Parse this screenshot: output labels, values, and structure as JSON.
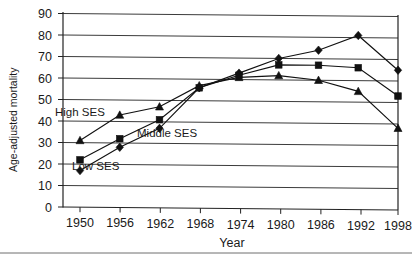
{
  "chart_data": {
    "type": "line",
    "title": "",
    "xlabel": "Year",
    "ylabel": "Age-adjusted mortality",
    "categories": [
      1950,
      1956,
      1962,
      1968,
      1974,
      1980,
      1986,
      1992,
      1998
    ],
    "x": [
      1950,
      1956,
      1962,
      1968,
      1974,
      1980,
      1986,
      1992,
      1998
    ],
    "xlim": [
      1950,
      1998
    ],
    "ylim": [
      0,
      90
    ],
    "yticks": [
      0,
      10,
      20,
      30,
      40,
      50,
      60,
      70,
      80,
      90
    ],
    "xticks": [
      "1950",
      "1956",
      "1962",
      "1968",
      "1974",
      "1980",
      "1986",
      "1992",
      "1998"
    ],
    "grid": "horizontal",
    "legend": "inline-annotations",
    "series": [
      {
        "name": "Low SES",
        "marker": "diamond",
        "values": [
          17,
          28,
          37,
          56,
          63,
          70,
          74,
          81,
          65
        ]
      },
      {
        "name": "Middle SES",
        "marker": "square",
        "values": [
          22,
          32,
          41,
          56,
          62,
          67,
          67,
          66,
          53
        ]
      },
      {
        "name": "High SES",
        "marker": "triangle",
        "values": [
          31,
          43,
          47,
          57,
          61,
          62,
          60,
          55,
          38
        ]
      }
    ],
    "annotations": [
      {
        "text": "High SES",
        "x_px": 55,
        "y_px": 112
      },
      {
        "text": "Middle SES",
        "x_px": 137,
        "y_px": 133
      },
      {
        "text": "Low SES",
        "x_px": 72,
        "y_px": 166
      }
    ]
  },
  "axes": {
    "y_title": "Age-adjusted mortality",
    "x_title": "Year",
    "y_tick_labels": [
      "90",
      "80",
      "70",
      "60",
      "50",
      "40",
      "30",
      "20",
      "10",
      "0"
    ],
    "x_tick_labels": [
      "1950",
      "1956",
      "1962",
      "1968",
      "1974",
      "1980",
      "1986",
      "1992",
      "1998"
    ]
  },
  "labels": {
    "high_ses": "High SES",
    "middle_ses": "Middle SES",
    "low_ses": "Low SES"
  }
}
